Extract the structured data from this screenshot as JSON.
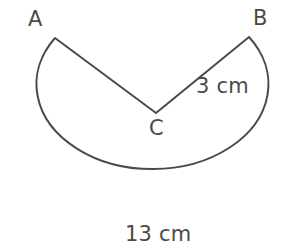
{
  "figure": {
    "stroke_color": "#4a4a4a",
    "text_color": "#4a4a4a",
    "background_color": "#ffffff",
    "stroke_width": 2,
    "vertices": {
      "A": {
        "label": "A",
        "x": 55,
        "y": 38
      },
      "B": {
        "label": "B",
        "x": 249,
        "y": 37
      },
      "C": {
        "label": "C",
        "x": 156,
        "y": 113
      }
    },
    "measurements": {
      "radius": {
        "label": "3 cm",
        "value": 3,
        "unit": "cm",
        "applies_to": "CB"
      },
      "diameter": {
        "label": "13 cm",
        "value": 13,
        "unit": "cm",
        "applies_to": "arc-width"
      }
    },
    "circle": {
      "center_x": 152,
      "center_y": 120,
      "radius_x": 116,
      "radius_y": 85
    },
    "path": "M 55 38 L 156 113 L 249 37 A 116 85 0 1 1 55 38 Z"
  }
}
